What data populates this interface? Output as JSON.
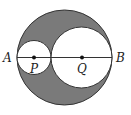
{
  "diagram": {
    "type": "geometry",
    "colors": {
      "shaded": "#7a7a7a",
      "stroke": "#333333",
      "background": "#ffffff"
    },
    "outer_circle": {
      "cx": 64.5,
      "cy": 57.5,
      "r": 47.5
    },
    "circle_p": {
      "cx": 34,
      "cy": 57.5,
      "r": 17
    },
    "circle_q": {
      "cx": 81.5,
      "cy": 57.5,
      "r": 30.5
    },
    "labels": {
      "a": "A",
      "b": "B",
      "p": "P",
      "q": "Q"
    }
  }
}
